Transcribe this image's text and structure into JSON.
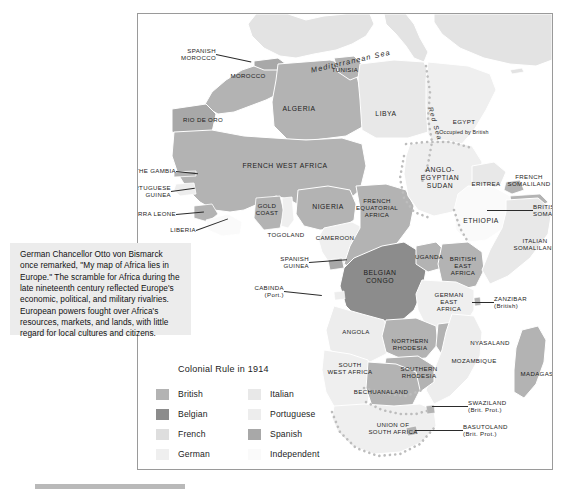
{
  "map": {
    "title": "Africa under colonial rule, 1914",
    "frame": {
      "x": 137,
      "y": 13,
      "w": 414,
      "h": 455
    },
    "seas": [
      {
        "name": "Mediterranean Sea",
        "x": 172,
        "y": 52,
        "rot": -13
      },
      {
        "name": "Red Sea",
        "x": 296,
        "y": 92,
        "rot": 74
      }
    ],
    "labels": [
      {
        "name": "spanish-morocco",
        "text": "SPANISH\nMOROCCO",
        "x": 78,
        "y": 40,
        "align": "right",
        "leader": {
          "len": 36,
          "ang": 12
        }
      },
      {
        "name": "morocco",
        "text": "MOROCCO",
        "x": 110,
        "y": 62,
        "align": "center"
      },
      {
        "name": "rio-de-oro",
        "text": "RIO DE ORO",
        "x": 65,
        "y": 106,
        "align": "center"
      },
      {
        "name": "algeria",
        "text": "ALGERIA",
        "x": 161,
        "y": 95,
        "align": "center",
        "size": "big"
      },
      {
        "name": "tunisia",
        "text": "TUNISIA",
        "x": 207,
        "y": 56,
        "align": "center"
      },
      {
        "name": "libya",
        "text": "LIBYA",
        "x": 248,
        "y": 100,
        "align": "center",
        "size": "big"
      },
      {
        "name": "egypt",
        "text": "EGYPT",
        "x": 326,
        "y": 108,
        "align": "center"
      },
      {
        "name": "egypt-note",
        "text": "Occupied by British",
        "x": 326,
        "y": 118,
        "align": "center",
        "size": "sm"
      },
      {
        "name": "the-gambia",
        "text": "THE GAMBIA",
        "x": 38,
        "y": 157,
        "align": "right",
        "leader": {
          "len": 22,
          "ang": 6
        }
      },
      {
        "name": "portuguese-guinea",
        "text": "PORTUGUESE\nGUINEA",
        "x": 33,
        "y": 177,
        "align": "right",
        "leader": {
          "len": 24,
          "ang": -8
        }
      },
      {
        "name": "sierra-leone",
        "text": "SIERRA LEONE",
        "x": 38,
        "y": 200,
        "align": "right",
        "leader": {
          "len": 28,
          "ang": -5
        }
      },
      {
        "name": "liberia",
        "text": "LIBERIA",
        "x": 58,
        "y": 216,
        "align": "right",
        "leader": {
          "len": 34,
          "ang": -20
        }
      },
      {
        "name": "french-west-africa",
        "text": "FRENCH WEST AFRICA",
        "x": 147,
        "y": 152,
        "align": "center",
        "size": "big"
      },
      {
        "name": "gold-coast",
        "text": "GOLD\nCOAST",
        "x": 129,
        "y": 195,
        "align": "center"
      },
      {
        "name": "togoland",
        "text": "TOGOLAND",
        "x": 148,
        "y": 221,
        "align": "center"
      },
      {
        "name": "nigeria",
        "text": "NIGERIA",
        "x": 190,
        "y": 193,
        "align": "center",
        "size": "big"
      },
      {
        "name": "cameroon",
        "text": "CAMEROON",
        "x": 197,
        "y": 224,
        "align": "center"
      },
      {
        "name": "spanish-guinea",
        "text": "SPANISH\nGUINEA",
        "x": 171,
        "y": 248,
        "align": "right",
        "leader": {
          "len": 38,
          "ang": -4
        }
      },
      {
        "name": "cabinda",
        "text": "CABINDA\n(Port.)",
        "x": 146,
        "y": 277,
        "align": "right",
        "leader": {
          "len": 38,
          "ang": 6
        }
      },
      {
        "name": "french-equatorial-africa",
        "text": "FRENCH\nEQUATORIAL\nAFRICA",
        "x": 239,
        "y": 194,
        "align": "center"
      },
      {
        "name": "anglo-egyptian-sudan",
        "text": "ANGLO-\nEGYPTIAN\nSUDAN",
        "x": 302,
        "y": 164,
        "align": "center",
        "size": "big"
      },
      {
        "name": "eritrea",
        "text": "ERITREA",
        "x": 348,
        "y": 170,
        "align": "center"
      },
      {
        "name": "french-somaliland",
        "text": "FRENCH\nSOMALILAND",
        "x": 391,
        "y": 166,
        "align": "center"
      },
      {
        "name": "british-somaliland",
        "text": "BRITISH\nSOMALILAND",
        "x": 395,
        "y": 196,
        "align": "left",
        "leader": {
          "len": -46,
          "ang": 0
        }
      },
      {
        "name": "ethiopia",
        "text": "ETHIOPIA",
        "x": 343,
        "y": 207,
        "align": "center",
        "size": "big"
      },
      {
        "name": "italian-somaliland",
        "text": "ITALIAN\nSOMALILAND",
        "x": 397,
        "y": 230,
        "align": "center"
      },
      {
        "name": "belgian-congo",
        "text": "BELGIAN\nCONGO",
        "x": 242,
        "y": 263,
        "align": "center",
        "size": "big"
      },
      {
        "name": "uganda",
        "text": "UGANDA",
        "x": 291,
        "y": 243,
        "align": "center"
      },
      {
        "name": "british-east-africa",
        "text": "BRITISH\nEAST\nAFRICA",
        "x": 325,
        "y": 252,
        "align": "center"
      },
      {
        "name": "german-east-africa",
        "text": "GERMAN\nEAST\nAFRICA",
        "x": 311,
        "y": 288,
        "align": "center"
      },
      {
        "name": "zanzibar",
        "text": "ZANZIBAR\n(British)",
        "x": 356,
        "y": 288,
        "align": "left",
        "leader": {
          "len": -22,
          "ang": 0
        }
      },
      {
        "name": "angola",
        "text": "ANGOLA",
        "x": 218,
        "y": 318,
        "align": "center"
      },
      {
        "name": "northern-rhodesia",
        "text": "NORTHERN\nRHODESIA",
        "x": 272,
        "y": 330,
        "align": "center"
      },
      {
        "name": "nyasaland",
        "text": "NYASALAND",
        "x": 352,
        "y": 329,
        "align": "center"
      },
      {
        "name": "mozambique",
        "text": "MOZAMBIQUE",
        "x": 336,
        "y": 347,
        "align": "center"
      },
      {
        "name": "southern-rhodesia",
        "text": "SOUTHERN\nRHODESIA",
        "x": 281,
        "y": 358,
        "align": "center"
      },
      {
        "name": "south-west-africa",
        "text": "SOUTH\nWEST AFRICA",
        "x": 212,
        "y": 354,
        "align": "center"
      },
      {
        "name": "bechuanaland",
        "text": "BECHUANALAND",
        "x": 243,
        "y": 378,
        "align": "center"
      },
      {
        "name": "madagascar",
        "text": "MADAGASCAR",
        "x": 406,
        "y": 360,
        "align": "center"
      },
      {
        "name": "swaziland",
        "text": "SWAZILAND\n(Brit. Prot.)",
        "x": 330,
        "y": 392,
        "align": "left",
        "leader": {
          "len": -36,
          "ang": 0
        }
      },
      {
        "name": "basutoland",
        "text": "BASUTOLAND\n(Brit. Prot.)",
        "x": 325,
        "y": 416,
        "align": "left",
        "leader": {
          "len": -48,
          "ang": 0
        }
      },
      {
        "name": "union-of-south-africa",
        "text": "UNION OF\nSOUTH AFRICA",
        "x": 255,
        "y": 414,
        "align": "center"
      }
    ]
  },
  "caption": {
    "paragraph": "German Chancellor Otto von Bismarck once remarked, \"My map of Africa lies in Europe.\" The scramble for Africa during the late nineteenth century reflected Europe's economic, political, and military rivalries. European powers fought over Africa's resources, markets, and lands, with little regard for local cultures and citizens."
  },
  "legend": {
    "title": "Colonial Rule in 1914",
    "column1": [
      {
        "label": "British",
        "color": "#b3b3b3"
      },
      {
        "label": "Belgian",
        "color": "#8c8c8c"
      },
      {
        "label": "French",
        "color": "#dedede"
      },
      {
        "label": "German",
        "color": "#efefef"
      }
    ],
    "column2": [
      {
        "label": "Italian",
        "color": "#e8e8e8"
      },
      {
        "label": "Portuguese",
        "color": "#ededed"
      },
      {
        "label": "Spanish",
        "color": "#a8a8a8"
      },
      {
        "label": "Independent",
        "color": "#fafafa"
      }
    ]
  },
  "palette": {
    "british": "#b3b3b3",
    "belgian": "#8c8c8c",
    "french": "#dedede",
    "german": "#efefef",
    "italian": "#e8e8e8",
    "portuguese": "#ededed",
    "spanish": "#a8a8a8",
    "independent": "#fafafa",
    "europe": "#e3e3e3",
    "water": "#ffffff",
    "caption_bg": "#ececec",
    "frame_border": "#9a9a9a",
    "rule": "#b9b9b9"
  }
}
